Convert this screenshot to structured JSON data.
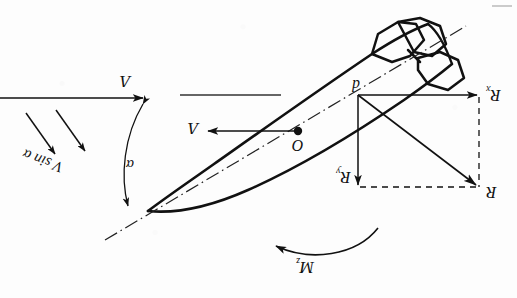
{
  "figure": {
    "background_color": "#fdfdfd",
    "ink_color": "#111111",
    "width": 517,
    "height": 298,
    "text_orientation": "labels printed rotated 180 degrees (inverted scan)"
  },
  "labels": {
    "velocity_freestream": "Λ",
    "velocity_body": "Λ",
    "velocity_normal": "V sin α",
    "angle_of_attack": "α",
    "center_of_mass": "O",
    "pressure_center": "d",
    "force_axial": "R",
    "force_axial_sub": "x",
    "force_normal": "R",
    "force_normal_sub": "y",
    "force_resultant": "R",
    "moment": "M",
    "moment_sub": "z"
  },
  "geometry": {
    "body": {
      "nose_tip": [
        148,
        211
      ],
      "tail_end": [
        432,
        42
      ],
      "axis_start": [
        105,
        240
      ],
      "axis_end": [
        466,
        26
      ],
      "center_of_mass_point": [
        298,
        131
      ],
      "pressure_center_point": [
        358,
        95
      ]
    },
    "vectors": [
      {
        "name": "freestream-velocity",
        "from": [
          0,
          98
        ],
        "to": [
          146,
          98
        ],
        "style": "solid-arrow"
      },
      {
        "name": "reference-line",
        "from": [
          180,
          95
        ],
        "to": [
          281,
          95
        ],
        "style": "solid-plain"
      },
      {
        "name": "body-velocity",
        "from": [
          298,
          131
        ],
        "to": [
          206,
          131
        ],
        "style": "solid-arrow"
      },
      {
        "name": "normal-velocity-1",
        "from": [
          26,
          113
        ],
        "to": [
          58,
          158
        ],
        "style": "solid-arrow"
      },
      {
        "name": "normal-velocity-2",
        "from": [
          55,
          110
        ],
        "to": [
          87,
          155
        ],
        "style": "solid-arrow"
      },
      {
        "name": "axial-force-Rx",
        "from": [
          358,
          95
        ],
        "to": [
          479,
          95
        ],
        "style": "solid-arrow"
      },
      {
        "name": "normal-force-Ry",
        "from": [
          358,
          95
        ],
        "to": [
          358,
          187
        ],
        "style": "solid-arrow"
      },
      {
        "name": "resultant-force-R",
        "from": [
          358,
          95
        ],
        "to": [
          479,
          187
        ],
        "style": "solid-arrow"
      },
      {
        "name": "construction-right",
        "from": [
          479,
          95
        ],
        "to": [
          479,
          187
        ],
        "style": "dashed"
      },
      {
        "name": "construction-bottom",
        "from": [
          358,
          187
        ],
        "to": [
          479,
          187
        ],
        "style": "dashed"
      },
      {
        "name": "angle-of-attack-arc",
        "from": [
          143,
          100
        ],
        "to": [
          129,
          210
        ],
        "style": "curved-double-arrow"
      },
      {
        "name": "pitching-moment-arc",
        "from": [
          370,
          233
        ],
        "to": [
          268,
          242
        ],
        "style": "curved-arrow"
      }
    ]
  }
}
